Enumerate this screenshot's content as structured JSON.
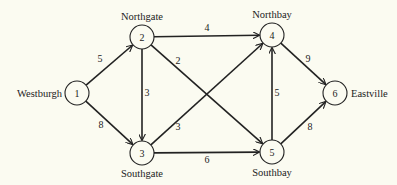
{
  "diagram": {
    "type": "directed-weighted-network",
    "nodes": [
      {
        "id": "1",
        "name": "Westburgh",
        "x": 77,
        "y": 93,
        "label_pos": "left"
      },
      {
        "id": "2",
        "name": "Northgate",
        "x": 142,
        "y": 37,
        "label_pos": "top"
      },
      {
        "id": "3",
        "name": "Southgate",
        "x": 142,
        "y": 153,
        "label_pos": "bottom"
      },
      {
        "id": "4",
        "name": "Northbay",
        "x": 272,
        "y": 35,
        "label_pos": "top"
      },
      {
        "id": "5",
        "name": "Southbay",
        "x": 272,
        "y": 152,
        "label_pos": "bottom"
      },
      {
        "id": "6",
        "name": "Eastville",
        "x": 335,
        "y": 93,
        "label_pos": "right"
      }
    ],
    "edges": [
      {
        "from": "1",
        "to": "2",
        "weight": "5",
        "wx": 100,
        "wy": 62
      },
      {
        "from": "1",
        "to": "3",
        "weight": "8",
        "wx": 101,
        "wy": 128
      },
      {
        "from": "2",
        "to": "3",
        "weight": "3",
        "wx": 147,
        "wy": 96
      },
      {
        "from": "2",
        "to": "4",
        "weight": "4",
        "wx": 207,
        "wy": 31
      },
      {
        "from": "2",
        "to": "5",
        "weight": "2",
        "wx": 178,
        "wy": 64
      },
      {
        "from": "3",
        "to": "4",
        "weight": "3",
        "wx": 178,
        "wy": 130
      },
      {
        "from": "3",
        "to": "5",
        "weight": "6",
        "wx": 207,
        "wy": 163
      },
      {
        "from": "4",
        "to": "6",
        "weight": "9",
        "wx": 308,
        "wy": 62
      },
      {
        "from": "5",
        "to": "4",
        "weight": "5",
        "wx": 277,
        "wy": 96
      },
      {
        "from": "5",
        "to": "6",
        "weight": "8",
        "wx": 310,
        "wy": 130
      }
    ],
    "node_radius": 12
  }
}
